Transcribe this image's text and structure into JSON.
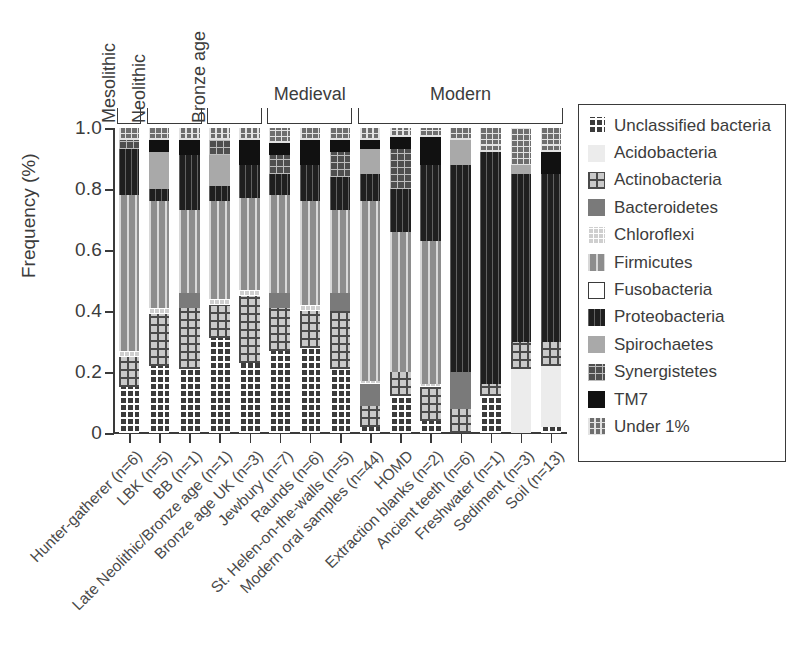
{
  "chart_data": {
    "type": "bar",
    "subtype": "stacked-bar",
    "title": "",
    "xlabel": "",
    "ylabel": "Frequency (%)",
    "ylim": [
      0,
      1.0
    ],
    "yticks": [
      "0",
      "0.2",
      "0.4",
      "0.6",
      "0.8",
      "1.0"
    ],
    "ytick_values": [
      0,
      0.2,
      0.4,
      0.6,
      0.8,
      1.0
    ],
    "grid": false,
    "legend_position": "right",
    "stack_order_bottom_to_top": [
      "Unclassified bacteria",
      "Acidobacteria",
      "Actinobacteria",
      "Bacteroidetes",
      "Chloroflexi",
      "Firmicutes",
      "Fusobacteria",
      "Proteobacteria",
      "Spirochaetes",
      "Synergistetes",
      "TM7",
      "Under 1%"
    ],
    "categories": [
      "Hunter-gatherer (n=6)",
      "LBK (n=5)",
      "BB (n=1)",
      "Late Neolithic/Bronze age (n=1)",
      "Bronze age UK (n=3)",
      "Jewbury (n=7)",
      "Raunds (n=6)",
      "St. Helen-on-the-walls (n=5)",
      "Modern oral samples (n=44)",
      "HOMD",
      "Extraction blanks (n=2)",
      "Ancient teeth (n=6)",
      "Freshwater (n=1)",
      "Sediment (n=3)",
      "Soil (n=13)"
    ],
    "series": [
      {
        "name": "Unclassified bacteria",
        "values": [
          0.15,
          0.22,
          0.21,
          0.31,
          0.23,
          0.27,
          0.28,
          0.21,
          0.02,
          0.12,
          0.04,
          0.0,
          0.12,
          0.0,
          0.02
        ]
      },
      {
        "name": "Acidobacteria",
        "values": [
          0.0,
          0.0,
          0.0,
          0.0,
          0.0,
          0.0,
          0.0,
          0.0,
          0.0,
          0.0,
          0.0,
          0.0,
          0.0,
          0.21,
          0.2
        ]
      },
      {
        "name": "Actinobacteria",
        "values": [
          0.1,
          0.17,
          0.2,
          0.11,
          0.22,
          0.14,
          0.12,
          0.19,
          0.07,
          0.08,
          0.11,
          0.08,
          0.04,
          0.09,
          0.08
        ]
      },
      {
        "name": "Bacteroidetes",
        "values": [
          0.0,
          0.0,
          0.05,
          0.0,
          0.0,
          0.05,
          0.0,
          0.06,
          0.07,
          0.0,
          0.0,
          0.12,
          0.0,
          0.0,
          0.0
        ]
      },
      {
        "name": "Chloroflexi",
        "values": [
          0.02,
          0.02,
          0.0,
          0.02,
          0.02,
          0.0,
          0.02,
          0.0,
          0.01,
          0.0,
          0.01,
          0.0,
          0.0,
          0.0,
          0.0
        ]
      },
      {
        "name": "Firmicutes",
        "values": [
          0.51,
          0.35,
          0.27,
          0.32,
          0.3,
          0.32,
          0.34,
          0.27,
          0.59,
          0.46,
          0.47,
          0.0,
          0.0,
          0.0,
          0.0
        ]
      },
      {
        "name": "Fusobacteria",
        "values": [
          0.0,
          0.0,
          0.0,
          0.0,
          0.0,
          0.0,
          0.0,
          0.0,
          0.0,
          0.0,
          0.0,
          0.0,
          0.0,
          0.0,
          0.0
        ]
      },
      {
        "name": "Proteobacteria",
        "values": [
          0.15,
          0.04,
          0.18,
          0.05,
          0.11,
          0.07,
          0.12,
          0.11,
          0.09,
          0.14,
          0.25,
          0.68,
          0.76,
          0.55,
          0.55
        ]
      },
      {
        "name": "Spirochaetes",
        "values": [
          0.0,
          0.12,
          0.0,
          0.1,
          0.0,
          0.0,
          0.0,
          0.0,
          0.08,
          0.0,
          0.0,
          0.08,
          0.0,
          0.03,
          0.0
        ]
      },
      {
        "name": "Synergistetes",
        "values": [
          0.03,
          0.0,
          0.0,
          0.05,
          0.0,
          0.06,
          0.0,
          0.08,
          0.0,
          0.13,
          0.0,
          0.0,
          0.0,
          0.0,
          0.0
        ]
      },
      {
        "name": "TM7",
        "values": [
          0.0,
          0.04,
          0.05,
          0.0,
          0.08,
          0.04,
          0.08,
          0.04,
          0.03,
          0.04,
          0.09,
          0.0,
          0.0,
          0.0,
          0.07
        ]
      },
      {
        "name": "Under 1%",
        "values": [
          0.04,
          0.04,
          0.04,
          0.04,
          0.04,
          0.05,
          0.04,
          0.04,
          0.04,
          0.03,
          0.03,
          0.04,
          0.08,
          0.12,
          0.08
        ]
      }
    ],
    "period_groups": [
      {
        "label": "Mesolithic",
        "start_index": 0,
        "end_index": 0,
        "orientation": "vertical"
      },
      {
        "label": "Neolithic",
        "start_index": 1,
        "end_index": 2,
        "orientation": "vertical"
      },
      {
        "label": "Bronze age",
        "start_index": 3,
        "end_index": 4,
        "orientation": "vertical"
      },
      {
        "label": "Medieval",
        "start_index": 5,
        "end_index": 7,
        "orientation": "horizontal"
      },
      {
        "label": "Modern",
        "start_index": 8,
        "end_index": 14,
        "orientation": "horizontal"
      }
    ]
  },
  "legend": {
    "entries": [
      {
        "label": "Unclassified bacteria",
        "pattern": "p-unclassified"
      },
      {
        "label": "Acidobacteria",
        "pattern": "p-acido"
      },
      {
        "label": "Actinobacteria",
        "pattern": "p-actino"
      },
      {
        "label": "Bacteroidetes",
        "pattern": "p-bacteroid"
      },
      {
        "label": "Chloroflexi",
        "pattern": "p-chloro"
      },
      {
        "label": "Firmicutes",
        "pattern": "p-firmi"
      },
      {
        "label": "Fusobacteria",
        "pattern": "p-fuso"
      },
      {
        "label": "Proteobacteria",
        "pattern": "p-proteo"
      },
      {
        "label": "Spirochaetes",
        "pattern": "p-spiro"
      },
      {
        "label": "Synergistetes",
        "pattern": "p-synerg"
      },
      {
        "label": "TM7",
        "pattern": "p-tm7"
      },
      {
        "label": "Under 1%",
        "pattern": "p-under1"
      }
    ]
  },
  "colors": {
    "axis": "#3a3a3a",
    "text": "#3c3c3c",
    "background": "#ffffff"
  }
}
